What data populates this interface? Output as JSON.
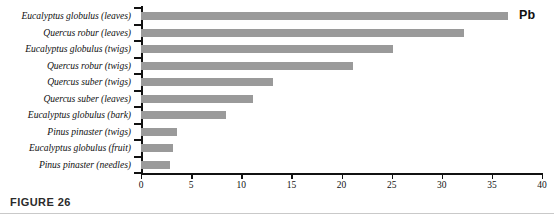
{
  "figure": {
    "caption_label": "FIGURE 26",
    "element_annotation": "Pb",
    "bar_color": "#9a9a9a",
    "axis_color": "#111111",
    "rule_color": "#c9c9c9"
  },
  "chart_data": {
    "type": "bar",
    "orientation": "horizontal",
    "title": "",
    "subtitle": "",
    "xlabel": "",
    "ylabel": "",
    "annotations": [
      "Pb"
    ],
    "grid": false,
    "legend": false,
    "xlim": [
      0,
      40
    ],
    "xticks": [
      0,
      5,
      10,
      15,
      20,
      25,
      30,
      35,
      40
    ],
    "xtick_labels": [
      "0",
      "5",
      "10",
      "15",
      "20",
      "25",
      "30",
      "35",
      "40"
    ],
    "categories": [
      "Eucalyptus globulus (leaves)",
      "Quercus robur (leaves)",
      "Eucalyptus globulus (twigs)",
      "Quercus robur (twigs)",
      "Quercus suber (twigs)",
      "Quercus suber (leaves)",
      "Eucalyptus globulus (bark)",
      "Pinus pinaster (twigs)",
      "Eucalyptus globulus (fruit)",
      "Pinus pinaster (needles)"
    ],
    "values": [
      36.6,
      32.2,
      25.1,
      21.1,
      13.2,
      11.2,
      8.5,
      3.6,
      3.2,
      2.9
    ]
  }
}
